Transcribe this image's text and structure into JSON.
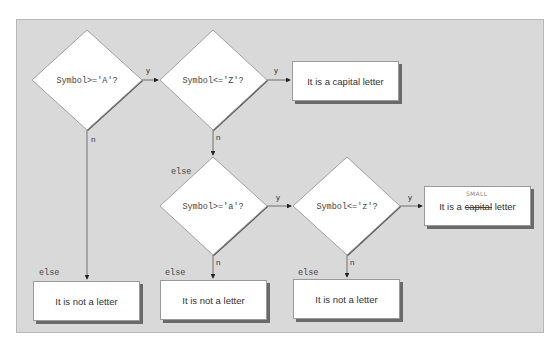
{
  "diagram": {
    "type": "flowchart",
    "decisions": [
      {
        "id": "d1",
        "label": "Symbol>='A'?"
      },
      {
        "id": "d2",
        "label": "Symbol<='Z'?"
      },
      {
        "id": "d3",
        "label": "Symbol>='a'?"
      },
      {
        "id": "d4",
        "label": "Symbol<='z'?"
      }
    ],
    "outcomes": [
      {
        "id": "capital",
        "label": "It is a capital letter"
      },
      {
        "id": "small",
        "prefix": "It is a ",
        "struck": "capital",
        "suffix": " letter",
        "handwritten_note": "SMALL"
      },
      {
        "id": "not1",
        "label": "It is not a letter"
      },
      {
        "id": "not2",
        "label": "It is not a letter"
      },
      {
        "id": "not3",
        "label": "It is not a letter"
      }
    ],
    "edge_labels": {
      "yes": "y",
      "no": "n",
      "else": "else"
    },
    "colors": {
      "background_panel": "#d9d9d9",
      "node_fill": "#ffffff",
      "shadow": "#6a6a6a",
      "line": "#555555"
    }
  }
}
